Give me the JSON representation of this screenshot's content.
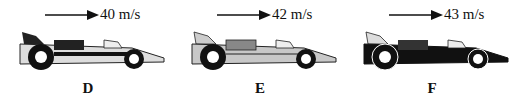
{
  "figure": {
    "cars": [
      {
        "label": "D",
        "speed": "40 m/s",
        "velocity_value": 40,
        "unit": "m/s",
        "direction": "right",
        "body_style": "light-with-black-stripe"
      },
      {
        "label": "E",
        "speed": "42 m/s",
        "velocity_value": 42,
        "unit": "m/s",
        "direction": "right",
        "body_style": "grey"
      },
      {
        "label": "F",
        "speed": "43 m/s",
        "velocity_value": 43,
        "unit": "m/s",
        "direction": "right",
        "body_style": "black"
      }
    ]
  }
}
